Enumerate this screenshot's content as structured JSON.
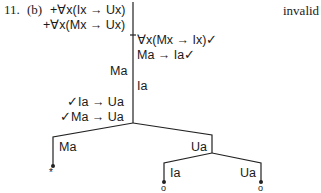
{
  "problem": {
    "number": "11.",
    "part": "(b)",
    "verdict": "invalid"
  },
  "premises": [
    "+∀x(Ix → Ux)",
    "+∀x(Mx → Ux)"
  ],
  "trunk_right": [
    "∀x(Mx → Ix)✓",
    "Ma → Ia✓"
  ],
  "trunk_left": [
    "Ma"
  ],
  "trunk_right_2": [
    "Ia"
  ],
  "trunk_left_2": [
    "✓Ia → Ua",
    "✓Ma → Ua"
  ],
  "branches": {
    "left": {
      "label": "Ma",
      "marker": "*"
    },
    "right": {
      "label": "Ua",
      "children": [
        {
          "label": "Ia",
          "marker": "o"
        },
        {
          "label": "Ua",
          "marker": "o"
        }
      ]
    }
  }
}
